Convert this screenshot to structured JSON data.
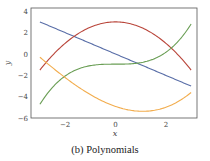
{
  "chart_data": {
    "type": "line",
    "title": "",
    "caption": "(b) Polynomials",
    "xlabel": "x",
    "ylabel": "y",
    "xlim": [
      -3.5,
      3.5
    ],
    "ylim": [
      -6,
      4.3
    ],
    "xticks": [
      -2,
      0,
      2
    ],
    "xtick_labels": [
      "−2",
      "0",
      "2"
    ],
    "yticks": [
      4,
      2,
      0,
      -2,
      -4,
      -6
    ],
    "ytick_labels": [
      "4",
      "2",
      "0",
      "−2",
      "−4",
      "−6"
    ],
    "grid": false,
    "legend": null,
    "x_range": [
      -3,
      3
    ],
    "series": [
      {
        "name": "linear",
        "color": "#5a6fa8",
        "coeffs": [
          0,
          -1,
          0,
          0
        ],
        "x": [
          -3,
          -2,
          -1,
          0,
          1,
          2,
          3
        ],
        "values": [
          3,
          2,
          1,
          0,
          -1,
          -2,
          -3
        ]
      },
      {
        "name": "quadratic",
        "color": "#b9453a",
        "coeffs": [
          3,
          0,
          -0.5,
          0
        ],
        "x": [
          -3,
          -2,
          -1,
          0,
          1,
          2,
          3
        ],
        "values": [
          -1.5,
          1,
          2.5,
          3,
          2.5,
          1,
          -1.5
        ]
      },
      {
        "name": "cubic",
        "color": "#6a9e55",
        "coeffs": [
          -0.95,
          0,
          0,
          0.139
        ],
        "x": [
          -3,
          -2,
          -1,
          0,
          1,
          2,
          3
        ],
        "values": [
          -4.7,
          -2.1,
          -1.1,
          -0.95,
          -0.8,
          0.16,
          2.8
        ]
      },
      {
        "name": "cubic-2",
        "color": "#f2ad4e",
        "coeffs": [
          -4.9,
          -0.81,
          0.328,
          0.029
        ],
        "x": [
          -3,
          -2,
          -1,
          0,
          1,
          2,
          3
        ],
        "values": [
          -0.3,
          -2.2,
          -3.8,
          -4.9,
          -5.35,
          -4.77,
          -3.6
        ]
      }
    ]
  }
}
